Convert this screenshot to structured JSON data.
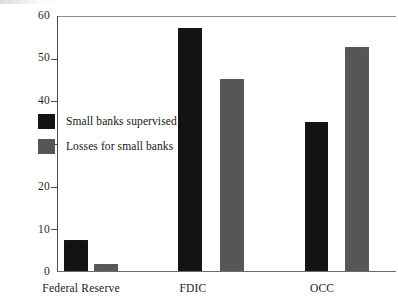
{
  "chart_data": {
    "type": "bar",
    "title": "",
    "subtitle": "",
    "xlabel": "",
    "ylabel": "",
    "categories": [
      "Federal Reserve",
      "FDIC",
      "OCC"
    ],
    "series": [
      {
        "name": "Small banks supervised",
        "color": "#131313",
        "values": [
          7.3,
          57,
          35
        ]
      },
      {
        "name": "Losses for small banks",
        "color": "#565656",
        "values": [
          1.6,
          45,
          52.5
        ]
      }
    ],
    "ylim": [
      0,
      60
    ],
    "yticks": [
      0,
      10,
      20,
      30,
      40,
      50,
      60
    ],
    "ytick_labels": [
      "0",
      "10",
      "20",
      "30",
      "40",
      "50",
      "60"
    ],
    "grid": false,
    "legend_position": "upper-left-inside",
    "annotations": []
  },
  "legend": {
    "items": [
      {
        "label": "Small banks supervised",
        "swatch": "dark"
      },
      {
        "label": "Losses for small banks",
        "swatch": "gray"
      }
    ]
  },
  "axes": {
    "y": {
      "ticks": [
        {
          "label": "60",
          "value": 60
        },
        {
          "label": "50",
          "value": 50
        },
        {
          "label": "40",
          "value": 40
        },
        {
          "label": "30",
          "value": 30
        },
        {
          "label": "20",
          "value": 20
        },
        {
          "label": "10",
          "value": 10
        },
        {
          "label": "0",
          "value": 0
        }
      ]
    },
    "x": {
      "labels": [
        "Federal Reserve",
        "FDIC",
        "OCC"
      ]
    }
  }
}
